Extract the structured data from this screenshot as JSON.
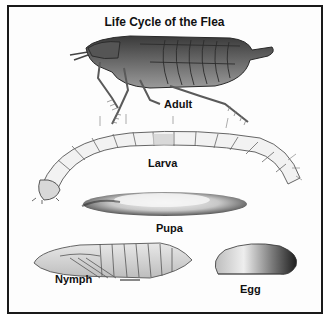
{
  "diagram": {
    "title": "Life Cycle of the Flea",
    "stages": [
      {
        "id": "adult",
        "label": "Adult"
      },
      {
        "id": "larva",
        "label": "Larva"
      },
      {
        "id": "pupa",
        "label": "Pupa"
      },
      {
        "id": "nymph",
        "label": "Nymph"
      },
      {
        "id": "egg",
        "label": "Egg"
      }
    ],
    "colors": {
      "border": "#1a1a1a",
      "background": "#ffffff",
      "ink": "#111111"
    }
  }
}
